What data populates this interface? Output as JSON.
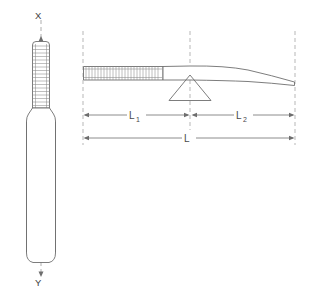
{
  "diagram": {
    "colors": {
      "line": "#6e6e6e",
      "thread": "#8a8a8a",
      "centerline": "#9a9a9a",
      "reference": "#a5a5a5",
      "text": "#4a4a4a",
      "background": "#ffffff"
    },
    "front_view": {
      "name": "front-view",
      "axis_top_label": "X",
      "axis_bottom_label": "Y",
      "threaded_shaft": {
        "name": "threaded-shaft",
        "thread_count": 17
      },
      "handle": {
        "name": "handle-body"
      }
    },
    "side_view": {
      "name": "side-view",
      "threaded_shaft": {
        "name": "threaded-shaft-side",
        "thread_count": 26
      },
      "fulcrum": {
        "name": "fulcrum-triangle"
      }
    },
    "dimensions": [
      {
        "id": "L1",
        "label": "L",
        "subscript": "1",
        "name": "dimension-l1",
        "y": 115,
        "x_start": 83,
        "x_end": 189
      },
      {
        "id": "L2",
        "label": "L",
        "subscript": "2",
        "name": "dimension-l2",
        "y": 115,
        "x_start": 191,
        "x_end": 295
      },
      {
        "id": "L",
        "label": "L",
        "subscript": "",
        "name": "dimension-l",
        "y": 138,
        "x_start": 83,
        "x_end": 295
      }
    ],
    "reference_lines": [
      {
        "name": "ref-line-left",
        "x": 83
      },
      {
        "name": "ref-line-center",
        "x": 190
      },
      {
        "name": "ref-line-right",
        "x": 295
      }
    ]
  }
}
